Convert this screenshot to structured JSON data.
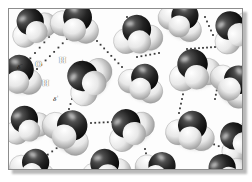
{
  "figure": {
    "background_color": "#fdfdfd",
    "frame_color": "#8d8d8d",
    "shadow_color": "#b9b9b9"
  },
  "legend": {
    "oxygen_color": "#1c1c1c",
    "hydrogen_color": "#f2f2f2",
    "hbond_color": "#3a3a3a"
  },
  "labels": {
    "oxygen": "O",
    "hydrogen_upper": "H",
    "hydrogen_lower": "H",
    "delta_negative": "δ",
    "delta_negative_sign": "−",
    "delta_positive_right": "δ",
    "delta_positive_right_sign": "+",
    "delta_positive_lower": "δ",
    "delta_positive_lower_sign": "+"
  },
  "molecules": [
    {
      "id": "m01",
      "cx": 22,
      "cy": 14,
      "r": 17,
      "rot": -28
    },
    {
      "id": "m02",
      "cx": 68,
      "cy": 10,
      "r": 18,
      "rot": 18
    },
    {
      "id": "m03",
      "cx": 128,
      "cy": 22,
      "r": 18,
      "rot": -8
    },
    {
      "id": "m04",
      "cx": 175,
      "cy": 8,
      "r": 17,
      "rot": 32
    },
    {
      "id": "m05",
      "cx": 222,
      "cy": 18,
      "r": 18,
      "rot": -42
    },
    {
      "id": "m06",
      "cx": 10,
      "cy": 62,
      "r": 18,
      "rot": 12
    },
    {
      "id": "m07",
      "cx": 75,
      "cy": 68,
      "r": 19,
      "rot": -55
    },
    {
      "id": "m08",
      "cx": 135,
      "cy": 70,
      "r": 17,
      "rot": 26
    },
    {
      "id": "m09",
      "cx": 184,
      "cy": 57,
      "r": 19,
      "rot": -14
    },
    {
      "id": "m10",
      "cx": 228,
      "cy": 72,
      "r": 18,
      "rot": 48
    },
    {
      "id": "m11",
      "cx": 16,
      "cy": 112,
      "r": 17,
      "rot": -20
    },
    {
      "id": "m12",
      "cx": 62,
      "cy": 118,
      "r": 19,
      "rot": 40
    },
    {
      "id": "m13",
      "cx": 118,
      "cy": 116,
      "r": 18,
      "rot": -36
    },
    {
      "id": "m14",
      "cx": 183,
      "cy": 118,
      "r": 18,
      "rot": 14
    },
    {
      "id": "m15",
      "cx": 226,
      "cy": 128,
      "r": 17,
      "rot": -50
    },
    {
      "id": "m16",
      "cx": 26,
      "cy": 155,
      "r": 17,
      "rot": 22
    },
    {
      "id": "m17",
      "cx": 96,
      "cy": 156,
      "r": 18,
      "rot": -10
    },
    {
      "id": "m18",
      "cx": 152,
      "cy": 158,
      "r": 17,
      "rot": 36
    },
    {
      "id": "m19",
      "cx": 214,
      "cy": 160,
      "r": 17,
      "rot": -30
    }
  ],
  "hydrogen_bonds": [
    {
      "id": "hb1",
      "x1": 40,
      "y1": 28,
      "x2": 12,
      "y2": 60,
      "dots": 7
    },
    {
      "id": "hb2",
      "x1": 58,
      "y1": 30,
      "x2": 28,
      "y2": 60,
      "dots": 8
    },
    {
      "id": "hb3",
      "x1": 88,
      "y1": 32,
      "x2": 113,
      "y2": 58,
      "dots": 8
    },
    {
      "id": "hb4",
      "x1": 118,
      "y1": 8,
      "x2": 112,
      "y2": 28,
      "dots": 5
    },
    {
      "id": "hb5",
      "x1": 150,
      "y1": 44,
      "x2": 128,
      "y2": 48,
      "dots": 6
    },
    {
      "id": "hb6",
      "x1": 196,
      "y1": 8,
      "x2": 204,
      "y2": 26,
      "dots": 5
    },
    {
      "id": "hb7",
      "x1": 178,
      "y1": 40,
      "x2": 206,
      "y2": 38,
      "dots": 8
    },
    {
      "id": "hb8",
      "x1": 176,
      "y1": 76,
      "x2": 170,
      "y2": 104,
      "dots": 7
    },
    {
      "id": "hb9",
      "x1": 60,
      "y1": 100,
      "x2": 66,
      "y2": 80,
      "dots": 5
    },
    {
      "id": "hb10",
      "x1": 82,
      "y1": 114,
      "x2": 124,
      "y2": 112,
      "dots": 11
    },
    {
      "id": "hb11",
      "x1": 52,
      "y1": 136,
      "x2": 30,
      "y2": 152,
      "dots": 6
    },
    {
      "id": "hb12",
      "x1": 136,
      "y1": 140,
      "x2": 142,
      "y2": 166,
      "dots": 7
    },
    {
      "id": "hb13",
      "x1": 212,
      "y1": 60,
      "x2": 206,
      "y2": 90,
      "dots": 8
    },
    {
      "id": "hb14",
      "x1": 196,
      "y1": 132,
      "x2": 228,
      "y2": 144,
      "dots": 8
    }
  ]
}
